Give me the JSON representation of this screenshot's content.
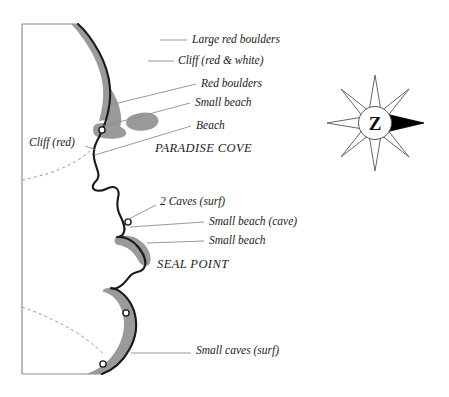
{
  "map": {
    "title": "Coastal sketch map",
    "colors": {
      "land": "#ffffff",
      "coastline": "#1a1a1a",
      "shading": "#9a9a9a",
      "shading_dark": "#8a8a8a",
      "frame": "#8d8d8d",
      "leader": "#8d8d8d",
      "contour": "#9a9a9a",
      "text": "#1a1a1a",
      "compass_fill": "#ffffff",
      "compass_stroke": "#444444",
      "compass_arrow": "#000000"
    },
    "annotations": [
      {
        "id": "large-red-boulders",
        "label": "Large red boulders",
        "x": 192,
        "y": 36,
        "leader": {
          "x1": 160,
          "y1": 40,
          "x2": 187,
          "y2": 40
        }
      },
      {
        "id": "cliff-red-white",
        "label": "Cliff (red & white)",
        "x": 178,
        "y": 58,
        "leader": {
          "x1": 148,
          "y1": 61,
          "x2": 174,
          "y2": 61
        }
      },
      {
        "id": "red-boulders",
        "label": "Red boulders",
        "x": 201,
        "y": 84,
        "leader": {
          "x1": 110,
          "y1": 105,
          "x2": 196,
          "y2": 87
        }
      },
      {
        "id": "small-beach-upper",
        "label": "Small beach",
        "x": 195,
        "y": 103,
        "leader": {
          "x1": 104,
          "y1": 126,
          "x2": 190,
          "y2": 106
        }
      },
      {
        "id": "beach",
        "label": "Beach",
        "x": 196,
        "y": 126,
        "leader": {
          "x1": 95,
          "y1": 154,
          "x2": 191,
          "y2": 129
        }
      },
      {
        "id": "cliff-red",
        "label": "Cliff (red)",
        "x": 29,
        "y": 143,
        "leader": null
      },
      {
        "id": "two-caves-surf",
        "label": "2 Caves (surf)",
        "x": 160,
        "y": 202,
        "leader": {
          "x1": 127,
          "y1": 220,
          "x2": 156,
          "y2": 208
        }
      },
      {
        "id": "small-beach-cave",
        "label": "Small beach (cave)",
        "x": 209,
        "y": 222,
        "leader": {
          "x1": 130,
          "y1": 227,
          "x2": 204,
          "y2": 225
        }
      },
      {
        "id": "small-beach-lower",
        "label": "Small beach",
        "x": 209,
        "y": 241,
        "leader": {
          "x1": 147,
          "y1": 245,
          "x2": 204,
          "y2": 245
        }
      },
      {
        "id": "small-caves-surf",
        "label": "Small caves (surf)",
        "x": 196,
        "y": 351,
        "leader": {
          "x1": 131,
          "y1": 355,
          "x2": 191,
          "y2": 355
        }
      }
    ],
    "places": [
      {
        "id": "paradise-cove",
        "label": "PARADISE COVE",
        "x": 155,
        "y": 148
      },
      {
        "id": "seal-point",
        "label": "SEAL POINT",
        "x": 157,
        "y": 264
      }
    ],
    "caves": [
      {
        "id": "cave-paradise",
        "cx": 102,
        "cy": 130
      },
      {
        "id": "cave-seal-upper",
        "cx": 128,
        "cy": 222
      },
      {
        "id": "cave-lower-a",
        "cx": 126,
        "cy": 313
      },
      {
        "id": "cave-lower-b",
        "cx": 103,
        "cy": 364
      }
    ],
    "compass": {
      "id": "compass-rose",
      "letter": "Z",
      "cx": 375,
      "cy": 123,
      "points": 8,
      "outer_radius": 48,
      "inner_radius": 15,
      "hub_radius": 16,
      "arrow_direction": "east"
    },
    "frame": {
      "left_x": 22,
      "top_y": 24,
      "bottom_y": 374,
      "top_right_x": 78,
      "bottom_right_x": 102
    }
  }
}
